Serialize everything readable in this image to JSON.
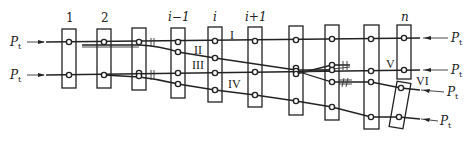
{
  "diagram": {
    "type": "switch-tie-bearer-layout",
    "force_label": "P",
    "force_subscript": "t",
    "tie_labels": [
      "1",
      "2",
      "",
      "i−1",
      "i",
      "i+1",
      "",
      "",
      "",
      "n"
    ],
    "rail_labels": {
      "I": "I",
      "II": "II",
      "III": "III",
      "IV": "IV",
      "V": "V",
      "VI": "VI"
    },
    "colors": {
      "stroke": "#222222",
      "background": "#ffffff"
    },
    "ties": [
      {
        "id": "tie-1",
        "label": "1",
        "x": 62,
        "y": 29,
        "w": 14,
        "h": 59,
        "rot": 0,
        "dots": [
          [
            69,
            42
          ],
          [
            69,
            75
          ]
        ]
      },
      {
        "id": "tie-2",
        "label": "2",
        "x": 97,
        "y": 29,
        "w": 14,
        "h": 59,
        "rot": 0,
        "dots": [
          [
            104,
            42
          ],
          [
            104,
            75
          ]
        ]
      },
      {
        "id": "tie-3",
        "label": "",
        "x": 132,
        "y": 28,
        "w": 14,
        "h": 62,
        "rot": 0,
        "dots": [
          [
            139,
            42
          ],
          [
            139,
            73
          ],
          [
            139,
            76
          ]
        ]
      },
      {
        "id": "tie-i-1",
        "label": "i−1",
        "x": 171,
        "y": 28,
        "w": 14,
        "h": 70,
        "rot": 0,
        "dots": [
          [
            178,
            42
          ],
          [
            178,
            52
          ],
          [
            178,
            73
          ],
          [
            178,
            84
          ]
        ]
      },
      {
        "id": "tie-i",
        "label": "i",
        "x": 208,
        "y": 27,
        "w": 14,
        "h": 75,
        "rot": 0,
        "dots": [
          [
            215,
            41
          ],
          [
            215,
            58
          ],
          [
            215,
            73
          ],
          [
            215,
            90
          ]
        ]
      },
      {
        "id": "tie-i+1",
        "label": "i+1",
        "x": 248,
        "y": 27,
        "w": 14,
        "h": 80,
        "rot": 0,
        "dots": [
          [
            255,
            41
          ],
          [
            255,
            72
          ],
          [
            255,
            95
          ]
        ]
      },
      {
        "id": "tie-7",
        "label": "",
        "x": 289,
        "y": 26,
        "w": 14,
        "h": 89,
        "rot": 0,
        "dots": [
          [
            296,
            40
          ],
          [
            296,
            68
          ],
          [
            296,
            71
          ],
          [
            296,
            74
          ],
          [
            296,
            101
          ]
        ]
      },
      {
        "id": "tie-8",
        "label": "",
        "x": 325,
        "y": 25,
        "w": 14,
        "h": 95,
        "rot": 0,
        "dots": [
          [
            332,
            39
          ],
          [
            332,
            65
          ],
          [
            332,
            70
          ],
          [
            332,
            82
          ],
          [
            332,
            107
          ]
        ]
      },
      {
        "id": "tie-9",
        "label": "",
        "x": 364,
        "y": 25,
        "w": 15,
        "h": 104,
        "rot": 0,
        "dots": [
          [
            371,
            39
          ],
          [
            371,
            71
          ],
          [
            371,
            82
          ],
          [
            371,
            117
          ]
        ]
      },
      {
        "id": "tie-n",
        "label": "n",
        "x": 397,
        "y": 25,
        "w": 14,
        "h": 54,
        "rot": 0,
        "dots": [
          [
            404,
            38
          ],
          [
            404,
            70
          ]
        ]
      },
      {
        "id": "tie-vi",
        "label": "",
        "x": 393,
        "y": 82,
        "w": 14,
        "h": 46,
        "rot": 10,
        "dots": [
          [
            401,
            88
          ],
          [
            399,
            117
          ]
        ]
      }
    ],
    "forces": [
      {
        "id": "force-left-top",
        "side": "left",
        "x_label": 8,
        "y": 42
      },
      {
        "id": "force-left-bottom",
        "side": "left",
        "x_label": 8,
        "y": 75
      },
      {
        "id": "force-right-1",
        "side": "right",
        "x_label": 450,
        "y": 38
      },
      {
        "id": "force-right-2",
        "side": "right",
        "x_label": 450,
        "y": 70
      },
      {
        "id": "force-right-3",
        "side": "right",
        "x_label": 446,
        "y": 90
      },
      {
        "id": "force-right-4",
        "side": "right",
        "x_label": 440,
        "y": 120
      }
    ]
  }
}
